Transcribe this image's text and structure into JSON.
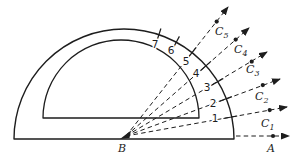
{
  "figure": {
    "background": "#ffffff",
    "ink": "#1d1d1d",
    "vertex_label": "B",
    "axis_point_label": "A",
    "scale_marks": [
      {
        "label": "1",
        "angle_deg": 10
      },
      {
        "label": "2",
        "angle_deg": 20
      },
      {
        "label": "3",
        "angle_deg": 31
      },
      {
        "label": "4",
        "angle_deg": 41
      },
      {
        "label": "5",
        "angle_deg": 52
      },
      {
        "label": "6",
        "angle_deg": 62
      },
      {
        "label": "7",
        "angle_deg": 72
      }
    ],
    "rays": [
      {
        "letter": "C",
        "sub": "1",
        "angle_deg": 10
      },
      {
        "letter": "C",
        "sub": "2",
        "angle_deg": 20
      },
      {
        "letter": "C",
        "sub": "3",
        "angle_deg": 31
      },
      {
        "letter": "C",
        "sub": "4",
        "angle_deg": 41
      },
      {
        "letter": "C",
        "sub": "5",
        "angle_deg": 52
      }
    ]
  }
}
